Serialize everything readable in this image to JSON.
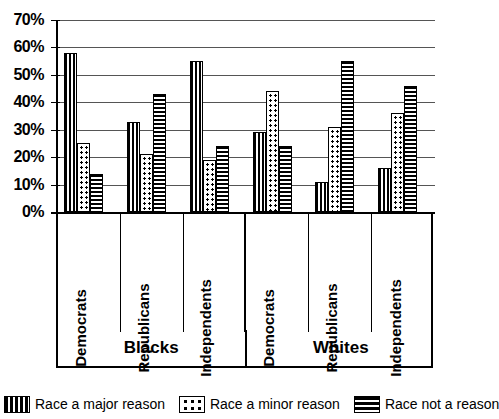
{
  "chart_data": {
    "type": "bar",
    "title": "",
    "xlabel": "",
    "ylabel": "",
    "ylim": [
      0,
      70
    ],
    "ytick_labels": [
      "70%",
      "60%",
      "50%",
      "40%",
      "30%",
      "20%",
      "10%",
      "0%"
    ],
    "ytick_values": [
      70,
      60,
      50,
      40,
      30,
      20,
      10,
      0
    ],
    "grid": true,
    "legend_position": "bottom",
    "panels": [
      "Blacks",
      "Whites"
    ],
    "categories": [
      "Democrats",
      "Republicans",
      "Independents",
      "Democrats",
      "Republicans",
      "Independents"
    ],
    "group_panel": [
      "Blacks",
      "Blacks",
      "Blacks",
      "Whites",
      "Whites",
      "Whites"
    ],
    "series": [
      {
        "name": "Race a major reason",
        "pattern": "vertical-stripes",
        "values": [
          58,
          33,
          55,
          29,
          11,
          16
        ]
      },
      {
        "name": "Race a minor reason",
        "pattern": "dots",
        "values": [
          25,
          21,
          19,
          44,
          31,
          36
        ]
      },
      {
        "name": "Race not a reason",
        "pattern": "horizontal-stripes",
        "values": [
          14,
          43,
          24,
          24,
          55,
          46
        ]
      }
    ]
  },
  "legend": {
    "items": [
      {
        "label": "Race a major reason",
        "pattern": "major"
      },
      {
        "label": "Race a minor reason",
        "pattern": "minor"
      },
      {
        "label": "Race not a reason",
        "pattern": "none"
      }
    ]
  },
  "colors": {
    "foreground": "#000000",
    "background": "#ffffff",
    "gridline": "#555555"
  }
}
